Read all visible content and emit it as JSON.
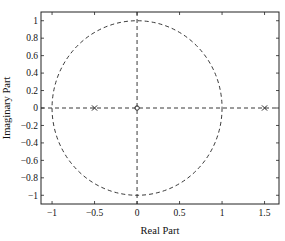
{
  "chart_data": {
    "type": "scatter",
    "title": "",
    "xlabel": "Real Part",
    "ylabel": "Imaginary Part",
    "xlim": [
      -1.13,
      1.67
    ],
    "ylim": [
      -1.1,
      1.1
    ],
    "grid": false,
    "legend": null,
    "xticks": [
      -1,
      -0.5,
      0,
      0.5,
      1,
      1.5
    ],
    "xtick_labels": [
      "−1",
      "−0.5",
      "0",
      "0.5",
      "1",
      "1.5"
    ],
    "yticks": [
      1,
      0.8,
      0.6,
      0.4,
      0.2,
      0,
      -0.2,
      -0.4,
      -0.6,
      -0.8,
      -1
    ],
    "ytick_labels": [
      "1",
      "0.8",
      "0.6",
      "0.4",
      "0.2",
      "0",
      "−0.2",
      "−0.4",
      "−0.6",
      "−0.8",
      "−1"
    ],
    "series": [
      {
        "name": "zeros",
        "marker": "o",
        "points": [
          [
            0,
            0
          ]
        ]
      },
      {
        "name": "poles",
        "marker": "x",
        "points": [
          [
            -0.5,
            0
          ],
          [
            1.5,
            0
          ]
        ]
      }
    ],
    "annotations": [
      {
        "type": "unit-circle",
        "style": "dashed",
        "radius": 1
      },
      {
        "type": "real-axis-line",
        "style": "dashed"
      },
      {
        "type": "imaginary-axis-line",
        "style": "dashed"
      }
    ]
  }
}
